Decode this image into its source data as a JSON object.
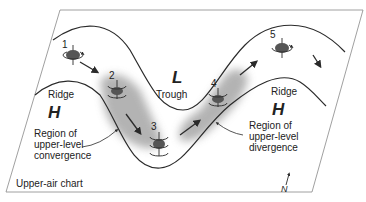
{
  "diagram": {
    "title": "Upper-air chart",
    "pressure_labels": {
      "low": "L",
      "high_left": "H",
      "high_right": "H"
    },
    "feature_labels": {
      "trough": "Trough",
      "ridge_left": "Ridge",
      "ridge_right": "Ridge"
    },
    "regions": {
      "convergence": [
        "Region of",
        "upper-level",
        "convergence"
      ],
      "divergence": [
        "Region of",
        "upper-level",
        "divergence"
      ]
    },
    "positions": [
      "1",
      "2",
      "3",
      "4",
      "5"
    ],
    "north_label": "N",
    "colors": {
      "line": "#2a2a2a",
      "shading": "#9a9a9a",
      "vortex": "#555555",
      "frame": "#888888",
      "background": "#ffffff"
    }
  }
}
